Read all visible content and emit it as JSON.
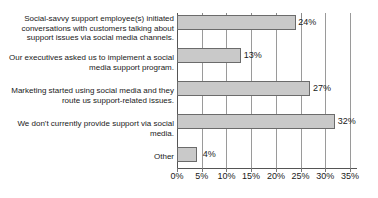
{
  "chart_data": {
    "type": "bar",
    "orientation": "horizontal",
    "title": "",
    "subtitle": "",
    "xlabel": "",
    "ylabel": "",
    "xlim": [
      0,
      35
    ],
    "xtick_labels": [
      "0%",
      "5%",
      "10%",
      "15%",
      "20%",
      "25%",
      "30%",
      "35%"
    ],
    "xtick_values": [
      0,
      5,
      10,
      15,
      20,
      25,
      30,
      35
    ],
    "grid": true,
    "legend": false,
    "bar_fill_color": "#c9c9c9",
    "bar_border_color": "#6b6b6b",
    "categories": [
      "Social-savvy support employee(s) initiated conversations with customers talking about support issues via social media channels.",
      "Our executives asked us to implement a social media support program.",
      "Marketing started using social media and they route us support-related issues.",
      "We don't currently provide support via social media.",
      "Other"
    ],
    "values": [
      24,
      13,
      27,
      32,
      4
    ],
    "data_labels": [
      "24%",
      "13%",
      "27%",
      "32%",
      "4%"
    ]
  }
}
